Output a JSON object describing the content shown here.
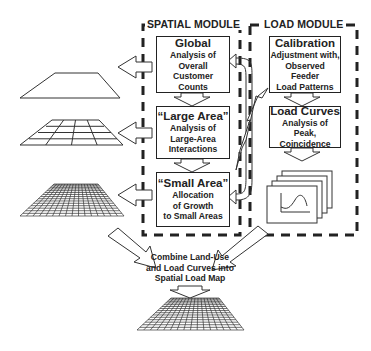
{
  "modules": {
    "spatial": {
      "title": "SPATIAL MODULE",
      "boxes": [
        {
          "title": "Global",
          "lines": [
            "Analysis of Overall",
            "Customer Counts"
          ]
        },
        {
          "title": "“Large Area”",
          "lines": [
            "Analysis of",
            "Large-Area",
            "Interactions"
          ]
        },
        {
          "title": "“Small Area”",
          "lines": [
            "Allocation",
            "of Growth",
            "to Small Areas"
          ]
        }
      ]
    },
    "load": {
      "title": "LOAD MODULE",
      "boxes": [
        {
          "title": "Calibration",
          "lines": [
            "Adjustment with,",
            "Observed Feeder",
            "Load Patterns"
          ]
        },
        {
          "title": "Load Curves",
          "lines": [
            "Analysis of Peak,",
            "Coincidence"
          ]
        }
      ]
    }
  },
  "combine": {
    "lines": [
      "Combine Land-Use",
      "and Load Curves into",
      "Spatial Load Map"
    ]
  },
  "grids": [
    {
      "name": "global-plane",
      "divisions": 0
    },
    {
      "name": "large-area-grid",
      "divisions": 4
    },
    {
      "name": "small-area-grid",
      "divisions": 16
    },
    {
      "name": "spatial-load-map-grid",
      "divisions": 16
    }
  ],
  "colors": {
    "ink": "#222222",
    "background": "#ffffff"
  }
}
